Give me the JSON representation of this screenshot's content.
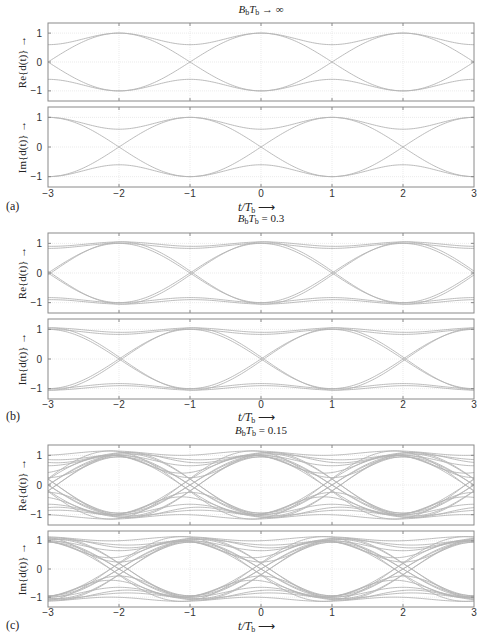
{
  "figure": {
    "panels": [
      {
        "label": "(a)",
        "title": "B_bT_b → ∞",
        "title_main": "B",
        "title_sub1": "b",
        "title_mid": "T",
        "title_sub2": "b",
        "title_rest": " → ∞"
      },
      {
        "label": "(b)",
        "title": "B_bT_b = 0.3",
        "title_main": "B",
        "title_sub1": "b",
        "title_mid": "T",
        "title_sub2": "b",
        "title_rest": " = 0.3"
      },
      {
        "label": "(c)",
        "title": "B_bT_b = 0.15",
        "title_main": "B",
        "title_sub1": "b",
        "title_mid": "T",
        "title_sub2": "b",
        "title_rest": " = 0.15"
      }
    ],
    "ylabel_re": "Re{d(t)} →",
    "ylabel_im": "Im{d(t)} →",
    "xlabel": "t/T_b ⟶",
    "xticks": [
      "−3",
      "−2",
      "−1",
      "0",
      "1",
      "2",
      "3"
    ],
    "yticks": [
      "1",
      "0",
      "−1"
    ],
    "line_color": "#b4b4b4",
    "grid_color": "#e6e6e6",
    "axis_color": "#8a8a8a"
  },
  "chart_data": [
    {
      "type": "line",
      "panel": "(a)",
      "title": "B_bT_b → ∞",
      "subplot": "Re{d(t)}",
      "xlabel": "t/T_b",
      "ylabel": "Re{d(t)}",
      "xlim": [
        -3,
        3
      ],
      "ylim": [
        -1.35,
        1.35
      ],
      "grid": true,
      "description": "Eye diagram of GMSK/MSK real part; eye openings maximal (±1) at t = -2, 0(?), 2 ... crossings at t=-3, -1, 1, 3 for Re; inner traces at ±0.6",
      "key_points": {
        "peaks_at_t": [
          -2,
          0,
          2
        ],
        "zero_crossings_at_t": [
          -3,
          -1,
          1,
          3
        ],
        "inner_level": 0.6
      }
    },
    {
      "type": "line",
      "panel": "(a)",
      "subplot": "Im{d(t)}",
      "xlim": [
        -3,
        3
      ],
      "ylim": [
        -1.35,
        1.35
      ],
      "grid": true,
      "key_points": {
        "peaks_at_t": [
          -3,
          -1,
          1,
          3
        ],
        "zero_crossings_at_t": [
          -2,
          0,
          2
        ],
        "inner_level": 0.6
      }
    },
    {
      "type": "line",
      "panel": "(b)",
      "title": "B_bT_b = 0.3",
      "subplot": "Re{d(t)}",
      "xlim": [
        -3,
        3
      ],
      "ylim": [
        -1.35,
        1.35
      ],
      "grid": true,
      "key_points": {
        "peaks_at_t": [
          -2,
          0,
          2
        ],
        "zero_crossings_at_t": [
          -3,
          -1,
          1,
          3
        ],
        "inner_level": 0.85
      }
    },
    {
      "type": "line",
      "panel": "(b)",
      "subplot": "Im{d(t)}",
      "xlim": [
        -3,
        3
      ],
      "ylim": [
        -1.35,
        1.35
      ],
      "grid": true,
      "key_points": {
        "peaks_at_t": [
          -3,
          -1,
          1,
          3
        ],
        "zero_crossings_at_t": [
          -2,
          0,
          2
        ],
        "inner_level": 0.85
      }
    },
    {
      "type": "line",
      "panel": "(c)",
      "title": "B_bT_b = 0.15",
      "subplot": "Re{d(t)}",
      "xlim": [
        -3,
        3
      ],
      "ylim": [
        -1.35,
        1.35
      ],
      "grid": true,
      "key_points": {
        "peaks_at_t": [
          -2,
          0,
          2
        ],
        "zero_crossings_at_t": [
          -3,
          -1,
          1,
          3
        ],
        "inner_levels": [
          0.4,
          0.7,
          0.9,
          1.1
        ]
      }
    },
    {
      "type": "line",
      "panel": "(c)",
      "subplot": "Im{d(t)}",
      "xlim": [
        -3,
        3
      ],
      "ylim": [
        -1.35,
        1.35
      ],
      "grid": true,
      "key_points": {
        "peaks_at_t": [
          -3,
          -1,
          1,
          3
        ],
        "zero_crossings_at_t": [
          -2,
          0,
          2
        ],
        "inner_levels": [
          0.4,
          0.7,
          0.9,
          1.1
        ]
      }
    }
  ]
}
